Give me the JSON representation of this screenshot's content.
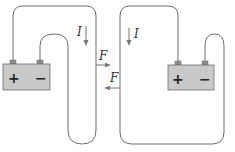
{
  "diagram": {
    "left_circuit": {
      "battery": {
        "positive_label": "+",
        "negative_label": "−"
      },
      "current_label": "I",
      "force_label": "F"
    },
    "right_circuit": {
      "battery": {
        "positive_label": "+",
        "negative_label": "−"
      },
      "current_label": "I",
      "force_label": "F"
    },
    "colors": {
      "wire": "#6e6e6e",
      "battery_fill": "#c9c9c9",
      "terminal_fill": "#8c8c8c",
      "arrow": "#777777"
    }
  }
}
